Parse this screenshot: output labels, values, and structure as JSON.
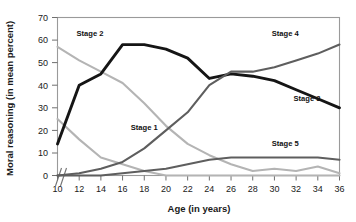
{
  "chart_data": {
    "type": "line",
    "title": "",
    "xlabel": "Age (in years)",
    "ylabel": "Moral reasoning (in mean percent)",
    "xlim": [
      10,
      36
    ],
    "ylim": [
      0,
      70
    ],
    "xticks": [
      10,
      12,
      14,
      16,
      18,
      20,
      22,
      24,
      26,
      28,
      30,
      32,
      34,
      36
    ],
    "yticks": [
      0,
      10,
      20,
      30,
      40,
      50,
      60,
      70
    ],
    "grid": false,
    "legend_position": "inline-annotations",
    "axis_break": "y-axis broken below 0",
    "x": [
      10,
      12,
      14,
      16,
      18,
      20,
      22,
      24,
      26,
      28,
      30,
      32,
      34,
      36
    ],
    "series": [
      {
        "name": "Stage 1",
        "color": "#b4b4b4",
        "label_x": 18,
        "label_y": 20,
        "values": [
          25,
          16,
          8,
          5,
          2,
          0,
          0,
          0,
          0,
          0,
          0,
          0,
          0,
          0
        ]
      },
      {
        "name": "Stage 2",
        "color": "#b4b4b4",
        "label_x": 13,
        "label_y": 62,
        "values": [
          57,
          51,
          46,
          41,
          32,
          22,
          14,
          9,
          5,
          2,
          3,
          2,
          4,
          1
        ]
      },
      {
        "name": "Stage 3",
        "color": "#151515",
        "label_x": 33,
        "label_y": 33,
        "values": [
          14,
          40,
          45,
          58,
          58,
          56,
          52,
          43,
          45,
          44,
          42,
          38,
          34,
          30
        ]
      },
      {
        "name": "Stage 4",
        "color": "#5e5e5e",
        "label_x": 31,
        "label_y": 62,
        "values": [
          0,
          1,
          3,
          6,
          12,
          20,
          28,
          40,
          46,
          46,
          48,
          51,
          54,
          58
        ]
      },
      {
        "name": "Stage 5",
        "color": "#5e5e5e",
        "label_x": 31,
        "label_y": 13,
        "values": [
          0,
          0,
          0,
          1,
          2,
          3,
          5,
          7,
          8,
          8,
          8,
          8,
          8,
          7
        ]
      }
    ]
  },
  "labels": {
    "ytick_0": "0",
    "ytick_10": "10",
    "ytick_20": "20",
    "ytick_30": "30",
    "ytick_40": "40",
    "ytick_50": "50",
    "ytick_60": "60",
    "ytick_70": "70",
    "xtick_10": "10",
    "xtick_12": "12",
    "xtick_14": "14",
    "xtick_16": "16",
    "xtick_18": "18",
    "xtick_20": "20",
    "xtick_22": "22",
    "xtick_24": "24",
    "xtick_26": "26",
    "xtick_28": "28",
    "xtick_30": "30",
    "xtick_32": "32",
    "xtick_34": "34",
    "xtick_36": "36",
    "series_1": "Stage 1",
    "series_2": "Stage 2",
    "series_3": "Stage 3",
    "series_4": "Stage 4",
    "series_5": "Stage 5",
    "x_axis_title": "Age (in years)",
    "y_axis_title": "Moral reasoning (in mean percent)"
  }
}
